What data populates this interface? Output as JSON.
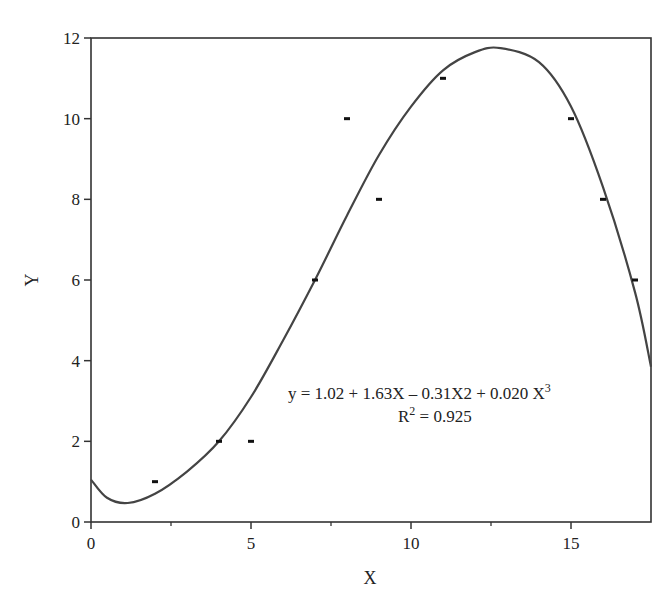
{
  "chart_data": {
    "type": "scatter",
    "title": "",
    "xlabel": "X",
    "ylabel": "Y",
    "xlim": [
      0,
      17.5
    ],
    "ylim": [
      0,
      12
    ],
    "grid": false,
    "legend": null,
    "x_ticks": [
      0,
      5,
      10,
      15
    ],
    "x_tick_labels": [
      "0",
      "5",
      "10",
      "15"
    ],
    "x_minor_ticks": [
      2.5,
      7.5,
      12.5
    ],
    "y_ticks": [
      0,
      2,
      4,
      6,
      8,
      10,
      12
    ],
    "y_tick_labels": [
      "0",
      "2",
      "4",
      "6",
      "8",
      "10",
      "12"
    ],
    "series": [
      {
        "name": "observed",
        "kind": "scatter",
        "marker": "dash",
        "x": [
          2,
          4,
          5,
          7,
          8,
          9,
          11,
          15,
          16,
          17
        ],
        "y": [
          1,
          2,
          2,
          6,
          10,
          8,
          11,
          10,
          8,
          6
        ]
      },
      {
        "name": "fitted curve",
        "kind": "line",
        "x": [
          0,
          0.5,
          1.15,
          2,
          3,
          4,
          5,
          6,
          7,
          8,
          9,
          10,
          11,
          12,
          12.8,
          14,
          15,
          16,
          17,
          17.5
        ],
        "y": [
          1.05,
          0.6,
          0.47,
          0.7,
          1.25,
          2.0,
          3.1,
          4.5,
          6.0,
          7.6,
          9.1,
          10.3,
          11.2,
          11.65,
          11.75,
          11.4,
          10.3,
          8.3,
          5.7,
          3.85
        ]
      }
    ],
    "annotations": [
      {
        "text_parts": [
          "y = 1.02 + 1.63X – 0.31X2 + 0.020 X",
          "3"
        ],
        "label": "equation"
      },
      {
        "text_parts": [
          "R",
          "2",
          " = 0.925"
        ],
        "label": "r-squared"
      }
    ]
  },
  "labels": {
    "xlabel": "X",
    "ylabel": "Y",
    "eq_main": "y = 1.02 + 1.63X – 0.31X2 + 0.020 X",
    "eq_sup": "3",
    "r2_base": "R",
    "r2_sup": "2",
    "r2_value": " = 0.925"
  }
}
